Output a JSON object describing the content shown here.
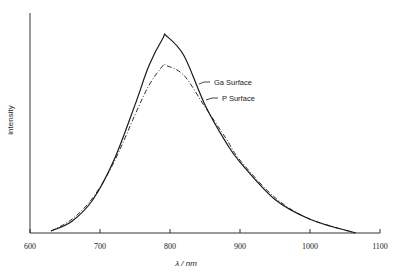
{
  "chart_data": {
    "type": "line",
    "title": "",
    "xlabel": "λ / nm",
    "ylabel": "intensity",
    "xlim": [
      600,
      1100
    ],
    "ylim": [
      0,
      1.05
    ],
    "x_ticks": [
      600,
      700,
      800,
      900,
      1000,
      1100
    ],
    "y_ticks": [],
    "grid": false,
    "legend_position": "inline-annotations",
    "x": [
      630,
      660,
      690,
      720,
      750,
      770,
      790,
      795,
      820,
      850,
      880,
      900,
      950,
      1000,
      1065
    ],
    "series": [
      {
        "name": "Ga Surface",
        "style": "solid",
        "values": [
          0.01,
          0.06,
          0.17,
          0.37,
          0.65,
          0.85,
          0.99,
          1.0,
          0.9,
          0.65,
          0.46,
          0.36,
          0.17,
          0.07,
          0.0
        ]
      },
      {
        "name": "P Surface",
        "style": "dashed",
        "values": [
          0.01,
          0.07,
          0.18,
          0.36,
          0.6,
          0.75,
          0.85,
          0.85,
          0.8,
          0.64,
          0.48,
          0.37,
          0.18,
          0.07,
          0.0
        ]
      }
    ],
    "annotations": [
      {
        "text": "Ga Surface",
        "target_series": "Ga Surface"
      },
      {
        "text": "P Surface",
        "target_series": "P Surface"
      }
    ]
  },
  "labels": {
    "xlabel": "λ / nm",
    "ylabel": "intensity",
    "ticks": [
      "600",
      "700",
      "800",
      "900",
      "1000",
      "1100"
    ],
    "legend": [
      "Ga Surface",
      "P Surface"
    ]
  },
  "colors": {
    "line": "#1a1a1a",
    "axis": "#333333"
  }
}
